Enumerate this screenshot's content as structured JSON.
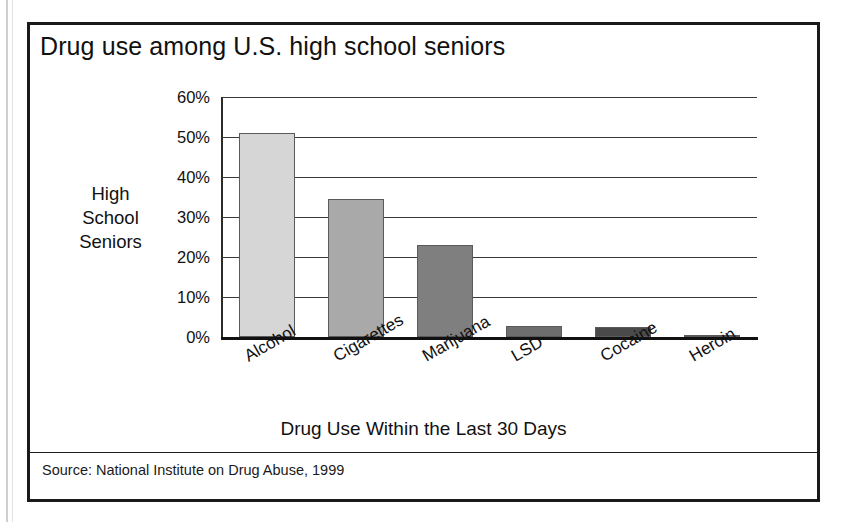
{
  "figure": {
    "title": "Drug use among U.S. high school seniors",
    "source": "Source: National Institute on Drug Abuse, 1999"
  },
  "chart_data": {
    "type": "bar",
    "title": "Drug use among U.S. high school seniors",
    "xlabel": "Drug Use Within the Last 30 Days",
    "ylabel": "High School Seniors",
    "ylabel_lines": [
      "High",
      "School",
      "Seniors"
    ],
    "categories": [
      "Alcohol",
      "Cigarettes",
      "Marijuana",
      "LSD",
      "Cocaine",
      "Heroin"
    ],
    "values": [
      51.0,
      34.6,
      23.1,
      2.7,
      2.6,
      0.6
    ],
    "value_labels": [
      "51%",
      "34.6%",
      "23.1%",
      "2.7%",
      "2.6%",
      "0.6%"
    ],
    "ylim": [
      0,
      60
    ],
    "ytick_values": [
      0,
      10,
      20,
      30,
      40,
      50,
      60
    ],
    "ytick_labels": [
      "0%",
      "10%",
      "20%",
      "30%",
      "40%",
      "50%",
      "60%"
    ],
    "grid": true,
    "legend": false,
    "bar_colors": [
      "#d6d6d6",
      "#a9a9a9",
      "#7f7f7f",
      "#6e6e6e",
      "#4a4a4a",
      "#1f1f1f"
    ],
    "source": "Source: National Institute on Drug Abuse, 1999"
  },
  "colors": {
    "frame": "#1a1a1a",
    "gridline": "#3a3a3a",
    "axis": "#111111",
    "text": "#111111",
    "background": "#ffffff"
  }
}
